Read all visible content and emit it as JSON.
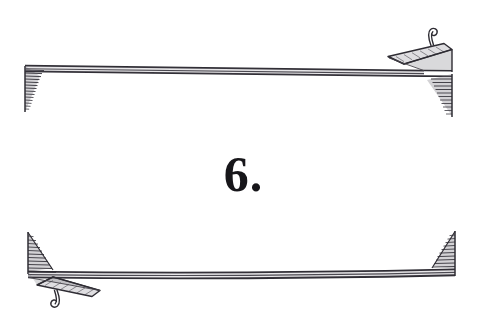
{
  "page": {
    "kind": "decorative-book-ornament",
    "background_color": "#ffffff",
    "ink_color": "#45434a",
    "numeral_color": "#17161a",
    "width": 487,
    "height": 333
  },
  "numeral": {
    "text": "6.",
    "value": 6,
    "suffix": "."
  },
  "ornaments": {
    "top_banner": {
      "name": "top-ribbon-banner",
      "bar_y": 68,
      "bar_left": 25,
      "bar_right": 452,
      "left_end": "hatched-tail-down",
      "right_end": "folded-ribbon-with-curl",
      "curl_side": "right",
      "curl_label": "spiral-curl"
    },
    "bottom_banner": {
      "name": "bottom-ribbon-banner",
      "bar_y": 274,
      "bar_left": 28,
      "bar_right": 455,
      "left_end": "folded-ribbon-with-curl",
      "right_end": "hatched-tail-up",
      "curl_side": "left",
      "curl_label": "spiral-curl"
    }
  },
  "colors": {
    "paper": "#ffffff",
    "ink": "#45434a",
    "ink_dark": "#2e2c33",
    "ink_light": "#6e6b75"
  }
}
